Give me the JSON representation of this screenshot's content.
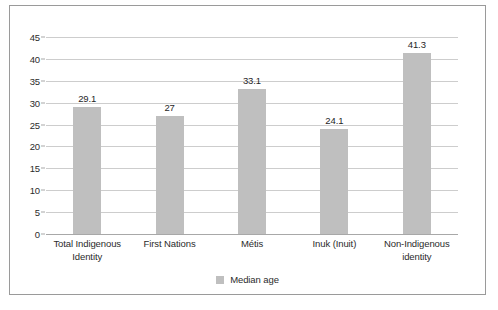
{
  "chart_data": {
    "type": "bar",
    "title": "",
    "xlabel": "",
    "ylabel": "",
    "categories": [
      "Total Indigenous Identity",
      "First Nations",
      "Métis",
      "Inuk (Inuit)",
      "Non-Indigenous identity"
    ],
    "category_lines": [
      [
        "Total Indigenous",
        "Identity"
      ],
      [
        "First Nations"
      ],
      [
        "Métis"
      ],
      [
        "Inuk (Inuit)"
      ],
      [
        "Non-Indigenous",
        "identity"
      ]
    ],
    "series": [
      {
        "name": "Median age",
        "values": [
          29.1,
          27,
          33.1,
          24.1,
          41.3
        ],
        "value_labels": [
          "29.1",
          "27",
          "33.1",
          "24.1",
          "41.3"
        ],
        "color": "#bfbfbf"
      }
    ],
    "ylim": [
      0,
      45
    ],
    "ytick_step": 5,
    "ytick_labels": [
      "0",
      "5",
      "10",
      "15",
      "20",
      "25",
      "30",
      "35",
      "40",
      "45"
    ],
    "grid": true,
    "legend": {
      "position": "bottom",
      "entries": [
        {
          "label": "Median age",
          "color": "#bfbfbf"
        }
      ]
    },
    "colors": {
      "bar": "#bfbfbf",
      "gridline": "#cdcdcd",
      "axis": "#a8a8a8",
      "border": "#9a9a9a",
      "text": "#2b2b2b",
      "background": "#ffffff"
    }
  }
}
